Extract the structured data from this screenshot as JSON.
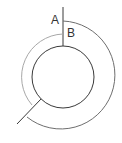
{
  "diagram": {
    "labels": {
      "a": "A",
      "b": "B"
    },
    "colors": {
      "outer_arc": "#6e6e6e",
      "inner_arc": "#a8a8a8",
      "circle": "#3a3a3a",
      "lines": "#3a3a3a",
      "text": "#333333"
    }
  }
}
